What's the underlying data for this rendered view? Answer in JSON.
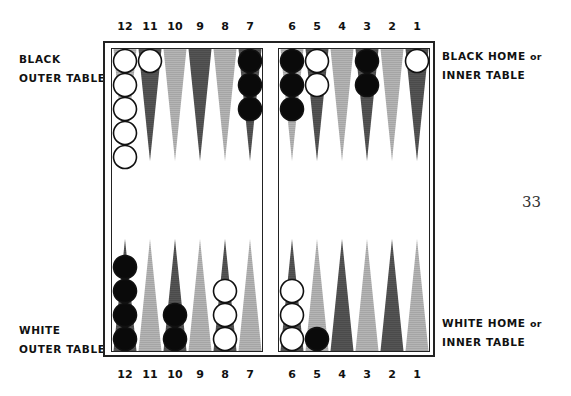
{
  "labels": {
    "top_left": [
      "BLACK",
      "OUTER TABLE"
    ],
    "top_right_line1": "BLACK HOME",
    "top_right_line1_suffix": "or",
    "top_right_line2": "INNER TABLE",
    "bottom_left": [
      "WHITE",
      "OUTER TABLE"
    ],
    "bottom_right_line1": "WHITE HOME",
    "bottom_right_line1_suffix": "or",
    "bottom_right_line2": "INNER TABLE"
  },
  "page_number": "33",
  "point_numbers": {
    "top": [
      "12",
      "11",
      "10",
      "9",
      "8",
      "7",
      "6",
      "5",
      "4",
      "3",
      "2",
      "1"
    ],
    "bottom": [
      "12",
      "11",
      "10",
      "9",
      "8",
      "7",
      "6",
      "5",
      "4",
      "3",
      "2",
      "1"
    ]
  },
  "colors": {
    "dark_point": "#555555",
    "light_point": "#b5b5b5",
    "black_checker": "#0a0a0a",
    "white_checker": "#ffffff",
    "frame": "#222222"
  },
  "board": {
    "top_row": [
      {
        "point": "12",
        "shade": "light",
        "checkers": {
          "color": "white",
          "count": 5
        }
      },
      {
        "point": "11",
        "shade": "dark",
        "checkers": {
          "color": "white",
          "count": 1
        }
      },
      {
        "point": "10",
        "shade": "light",
        "checkers": {
          "color": null,
          "count": 0
        }
      },
      {
        "point": "9",
        "shade": "dark",
        "checkers": {
          "color": null,
          "count": 0
        }
      },
      {
        "point": "8",
        "shade": "light",
        "checkers": {
          "color": null,
          "count": 0
        }
      },
      {
        "point": "7",
        "shade": "dark",
        "checkers": {
          "color": "black",
          "count": 3
        }
      },
      {
        "point": "6",
        "shade": "light",
        "checkers": {
          "color": "black",
          "count": 3
        }
      },
      {
        "point": "5",
        "shade": "dark",
        "checkers": {
          "color": "white",
          "count": 2
        }
      },
      {
        "point": "4",
        "shade": "light",
        "checkers": {
          "color": null,
          "count": 0
        }
      },
      {
        "point": "3",
        "shade": "dark",
        "checkers": {
          "color": "black",
          "count": 2
        }
      },
      {
        "point": "2",
        "shade": "light",
        "checkers": {
          "color": null,
          "count": 0
        }
      },
      {
        "point": "1",
        "shade": "dark",
        "checkers": {
          "color": "white",
          "count": 1
        }
      }
    ],
    "bottom_row": [
      {
        "point": "12",
        "shade": "dark",
        "checkers": {
          "color": "black",
          "count": 4
        }
      },
      {
        "point": "11",
        "shade": "light",
        "checkers": {
          "color": null,
          "count": 0
        }
      },
      {
        "point": "10",
        "shade": "dark",
        "checkers": {
          "color": "black",
          "count": 2
        }
      },
      {
        "point": "9",
        "shade": "light",
        "checkers": {
          "color": null,
          "count": 0
        }
      },
      {
        "point": "8",
        "shade": "dark",
        "checkers": {
          "color": "white",
          "count": 3
        }
      },
      {
        "point": "7",
        "shade": "light",
        "checkers": {
          "color": null,
          "count": 0
        }
      },
      {
        "point": "6",
        "shade": "dark",
        "checkers": {
          "color": "white",
          "count": 3
        }
      },
      {
        "point": "5",
        "shade": "light",
        "checkers": {
          "color": "black",
          "count": 1
        }
      },
      {
        "point": "4",
        "shade": "dark",
        "checkers": {
          "color": null,
          "count": 0
        }
      },
      {
        "point": "3",
        "shade": "light",
        "checkers": {
          "color": null,
          "count": 0
        }
      },
      {
        "point": "2",
        "shade": "dark",
        "checkers": {
          "color": null,
          "count": 0
        }
      },
      {
        "point": "1",
        "shade": "light",
        "checkers": {
          "color": null,
          "count": 0
        }
      }
    ]
  }
}
